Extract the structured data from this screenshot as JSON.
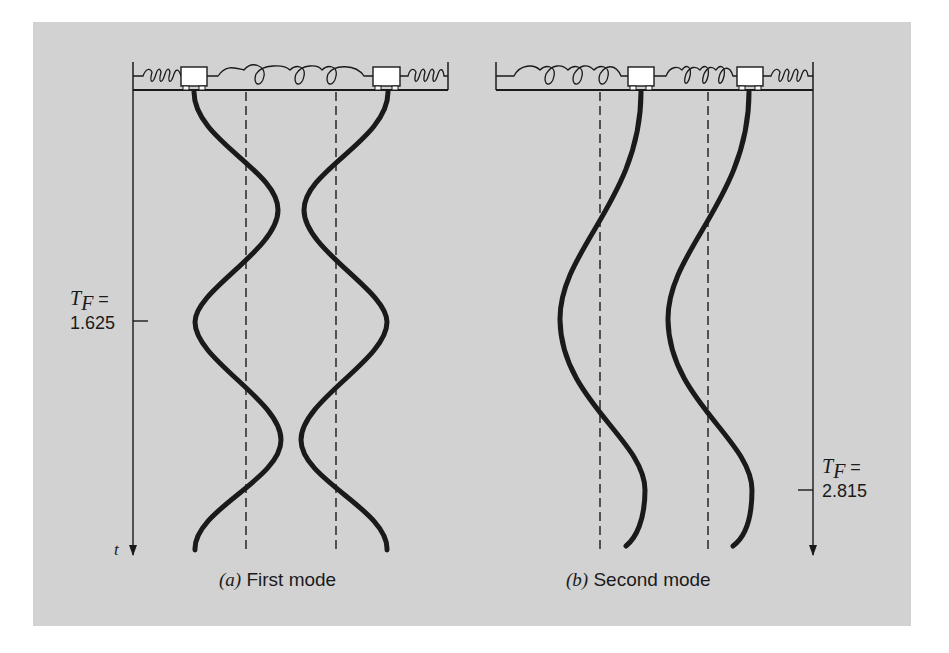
{
  "figure": {
    "background_color": "#d2d2d2",
    "ink_color": "#1a1a1a",
    "panels": [
      {
        "id": "a",
        "caption_letter": "(a)",
        "caption_text": " First mode",
        "period_label_symbol": "T",
        "period_label_subscript": "F",
        "period_label_equals": " =",
        "period_value": "1.625",
        "time_axis_label": "t",
        "masses": 2,
        "springs": [
          "outer-left",
          "middle",
          "outer-right"
        ],
        "motion": "masses oscillate out of phase (mirror-symmetric)"
      },
      {
        "id": "b",
        "caption_letter": "(b)",
        "caption_text": " Second mode",
        "period_label_symbol": "T",
        "period_label_subscript": "F",
        "period_label_equals": " =",
        "period_value": "2.815",
        "masses": 2,
        "springs": [
          "outer-left",
          "middle",
          "outer-right"
        ],
        "motion": "masses oscillate in phase"
      }
    ]
  }
}
